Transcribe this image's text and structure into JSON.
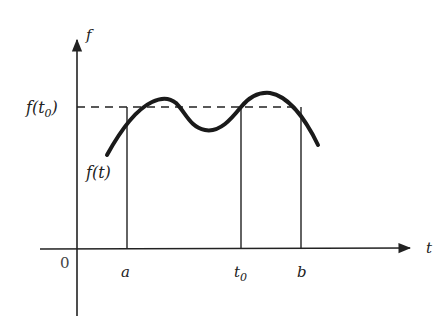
{
  "diagram": {
    "axes": {
      "x_label": "t",
      "y_label": "f",
      "origin_label": "0"
    },
    "labels": {
      "level": "f(t",
      "level_sub": "0",
      "level_close": ")",
      "curve": "f(t)",
      "a": "a",
      "t0": "t",
      "t0_sub": "0",
      "b": "b"
    },
    "colors": {
      "ink": "#222222",
      "background": "#ffffff"
    }
  }
}
